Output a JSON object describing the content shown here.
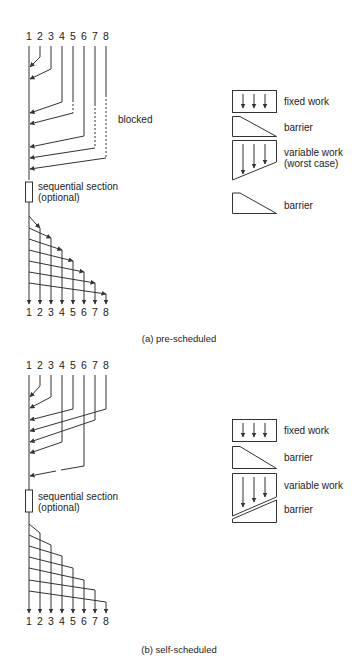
{
  "panels": [
    {
      "id": "a",
      "caption": "(a) pre-scheduled",
      "top_labels": [
        "1",
        "2",
        "3",
        "4",
        "5",
        "6",
        "7",
        "8"
      ],
      "bottom_labels": [
        "1",
        "2",
        "3",
        "4",
        "5",
        "6",
        "7",
        "8"
      ],
      "blocked_label": "blocked",
      "sequential_label_1": "sequential section",
      "sequential_label_2": "(optional)",
      "legend": {
        "fixed": "fixed work",
        "barrier1": "barrier",
        "variable_1": "variable work",
        "variable_2": "(worst case)",
        "barrier2": "barrier"
      }
    },
    {
      "id": "b",
      "caption": "(b) self-scheduled",
      "top_labels": [
        "1",
        "2",
        "3",
        "4",
        "5",
        "6",
        "7",
        "8"
      ],
      "bottom_labels": [
        "1",
        "2",
        "3",
        "4",
        "5",
        "6",
        "7",
        "8"
      ],
      "sequential_label_1": "sequential section",
      "sequential_label_2": "(optional)",
      "legend": {
        "fixed": "fixed work",
        "barrier1": "barrier",
        "variable_1": "variable work",
        "barrier2": "barrier"
      }
    }
  ],
  "colors": {
    "line": "#333333",
    "text": "#222222",
    "background": "#ffffff"
  }
}
